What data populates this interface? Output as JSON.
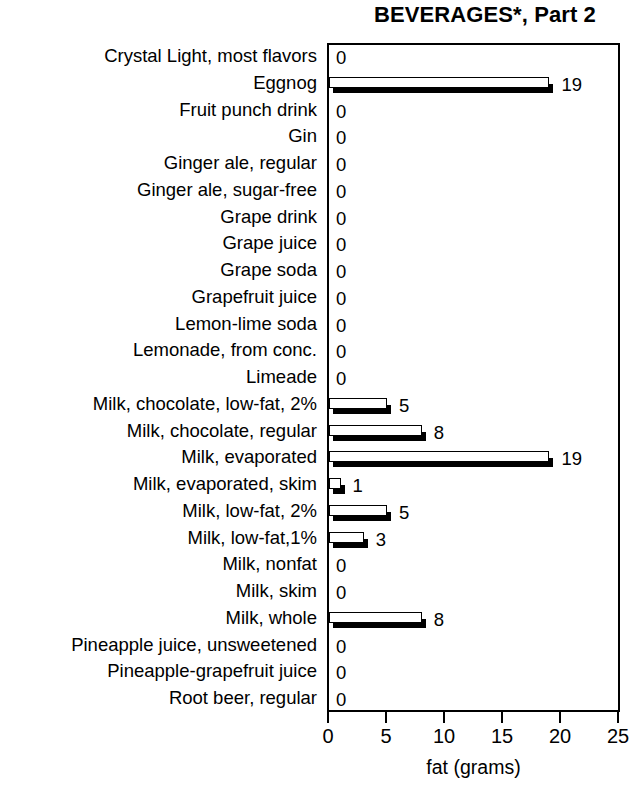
{
  "chart_data": {
    "type": "bar",
    "orientation": "horizontal",
    "title": "BEVERAGES*, Part 2",
    "xlabel": "fat (grams)",
    "ylabel": "",
    "xlim": [
      0,
      25
    ],
    "xticks": [
      0,
      5,
      10,
      15,
      20,
      25
    ],
    "xtick_labels": [
      "0",
      "5",
      "10",
      "15",
      "20",
      "25"
    ],
    "grid": false,
    "legend": null,
    "categories": [
      "Crystal Light, most flavors",
      "Eggnog",
      "Fruit punch drink",
      "Gin",
      "Ginger ale, regular",
      "Ginger ale, sugar-free",
      "Grape drink",
      "Grape juice",
      "Grape soda",
      "Grapefruit juice",
      "Lemon-lime soda",
      "Lemonade, from conc.",
      "Limeade",
      "Milk, chocolate, low-fat, 2%",
      "Milk, chocolate, regular",
      "Milk, evaporated",
      "Milk, evaporated, skim",
      "Milk, low-fat, 2%",
      "Milk, low-fat,1%",
      "Milk, nonfat",
      "Milk, skim",
      "Milk, whole",
      "Pineapple juice, unsweetened",
      "Pineapple-grapefruit juice",
      "Root beer, regular"
    ],
    "values": [
      0,
      19,
      0,
      0,
      0,
      0,
      0,
      0,
      0,
      0,
      0,
      0,
      0,
      5,
      8,
      19,
      1,
      5,
      3,
      0,
      0,
      8,
      0,
      0,
      0
    ],
    "value_labels": [
      "0",
      "19",
      "0",
      "0",
      "0",
      "0",
      "0",
      "0",
      "0",
      "0",
      "0",
      "0",
      "0",
      "5",
      "8",
      "19",
      "1",
      "5",
      "3",
      "0",
      "0",
      "8",
      "0",
      "0",
      "0"
    ],
    "colors": {
      "bar_fill": "#ffffff",
      "bar_outline": "#000000",
      "bar_shadow": "#000000",
      "axis": "#000000",
      "text": "#000000",
      "background": "#ffffff"
    }
  }
}
